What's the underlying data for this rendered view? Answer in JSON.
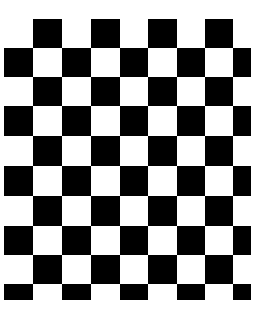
{
  "image": {
    "subject": "checkerboard pattern",
    "colors": {
      "dark": "#000000",
      "light": "#ffffff"
    }
  },
  "board": {
    "col_edges": [
      4,
      33,
      62,
      91,
      120,
      148,
      177,
      205,
      233,
      251
    ],
    "row_edges": [
      19,
      48,
      77,
      106,
      136,
      166,
      196,
      226,
      255,
      284,
      300
    ],
    "first_row_dark_starts_at_col": 1
  }
}
